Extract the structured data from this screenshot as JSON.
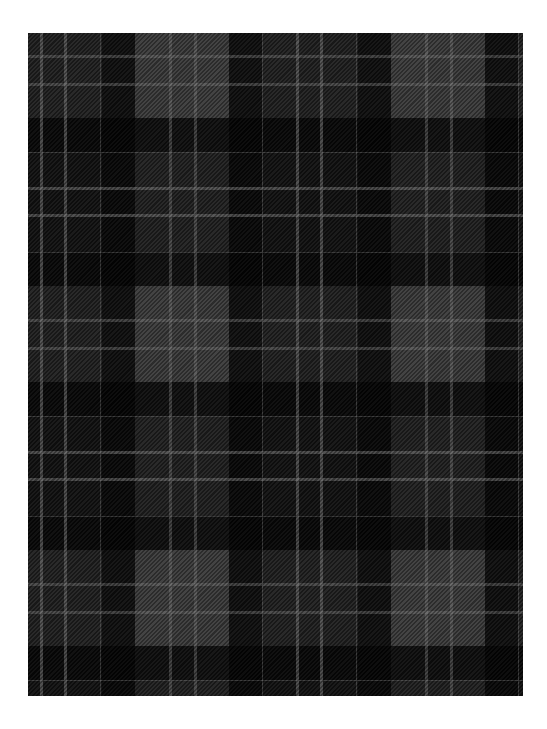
{
  "image": {
    "subject": "tartan plaid fabric swatch",
    "background_color": "#ffffff",
    "fabric_bounds": {
      "left": 28,
      "top": 33,
      "width": 495,
      "height": 663
    },
    "colors": {
      "gray": "#444444",
      "dark": "#262626",
      "black": "#050505",
      "line": "#6e6e6e"
    },
    "repeat": {
      "horizontal_px": 256,
      "vertical_px": 264
    }
  }
}
